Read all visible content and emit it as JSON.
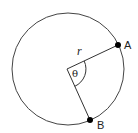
{
  "diagram": {
    "points": [
      {
        "id": "A",
        "label": "A"
      },
      {
        "id": "B",
        "label": "B"
      }
    ],
    "radius_label": "r",
    "angle_label": "θ",
    "colors": {
      "stroke": "#333333",
      "point": "#000000",
      "background": "#ffffff"
    }
  }
}
